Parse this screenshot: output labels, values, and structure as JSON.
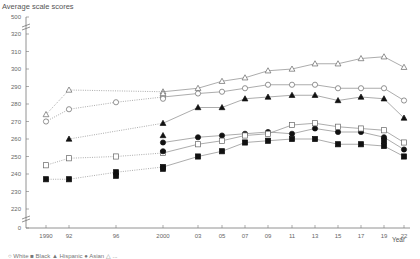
{
  "chart_data": {
    "type": "line",
    "title": "",
    "ylabel": "Average scale scores",
    "xlabel": "Year",
    "ylim": [
      215,
      320
    ],
    "y_axis_break": {
      "top_label": "500",
      "bottom_label": "0"
    },
    "y_ticks": [
      500,
      320,
      310,
      300,
      290,
      280,
      270,
      260,
      250,
      240,
      230,
      220,
      0
    ],
    "x_tick_labels": [
      "1990",
      "92",
      "96",
      "2000",
      "03",
      "05",
      "07",
      "09",
      "11",
      "13",
      "15",
      "17",
      "19",
      "22"
    ],
    "x": [
      1990,
      1992,
      1996,
      2000,
      2003,
      2005,
      2007,
      2009,
      2011,
      2013,
      2015,
      2017,
      2019,
      2022
    ],
    "grid": false,
    "legend_position": "bottom (cut off)",
    "series": [
      {
        "name": "open-triangle",
        "marker": "triangle-open",
        "values": [
          274,
          288,
          null,
          287,
          289,
          293,
          295,
          299,
          300,
          303,
          303,
          306,
          307,
          301
        ]
      },
      {
        "name": "open-circle",
        "marker": "circle-open",
        "values": [
          270,
          277,
          281,
          284,
          286,
          287,
          289,
          291,
          291,
          291,
          289,
          289,
          289,
          282
        ]
      },
      {
        "name": "filled-triangle",
        "marker": "triangle-filled",
        "values": [
          null,
          260,
          null,
          269,
          278,
          278,
          283,
          284,
          285,
          285,
          282,
          284,
          283,
          272
        ]
      },
      {
        "name": "filled-circle",
        "marker": "circle-filled",
        "values": [
          null,
          null,
          null,
          258,
          261,
          262,
          263,
          264,
          263,
          266,
          264,
          264,
          261,
          254
        ]
      },
      {
        "name": "open-square",
        "marker": "square-open",
        "values": [
          245,
          249,
          250,
          252,
          257,
          259,
          262,
          263,
          268,
          269,
          267,
          266,
          265,
          258
        ]
      },
      {
        "name": "filled-square",
        "marker": "square-filled",
        "values": [
          237,
          237,
          241,
          244,
          250,
          253,
          258,
          259,
          260,
          260,
          257,
          257,
          256,
          250
        ]
      }
    ],
    "extra_points_2000": {
      "open-triangle": 286,
      "open-circle": 283,
      "filled-triangle": 262,
      "filled-circle": 253,
      "filled-square": 243
    },
    "extra_points_1996": {
      "filled-square": 239
    },
    "extra_points_2019": {
      "filled-square": 259
    },
    "dotted_segments_before": 2000
  },
  "labels": {
    "ylabel": "Average scale scores",
    "xlabel": "Year",
    "legend": "○ White  ■ Black  ▲ Hispanic  ● Asian  △ ..."
  }
}
